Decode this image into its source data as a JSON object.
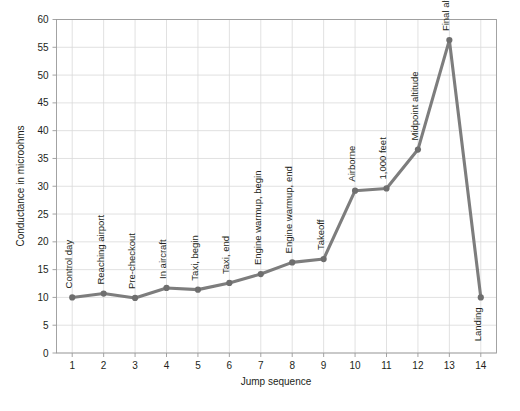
{
  "chart_data": {
    "type": "line",
    "title": "",
    "xlabel": "Jump sequence",
    "ylabel": "Conductance in microohms",
    "x": [
      1,
      2,
      3,
      4,
      5,
      6,
      7,
      8,
      9,
      10,
      11,
      12,
      13,
      14
    ],
    "xtick_labels": [
      "1",
      "2",
      "3",
      "4",
      "5",
      "6",
      "7",
      "8",
      "9",
      "10",
      "11",
      "12",
      "13",
      "14"
    ],
    "values": [
      10.0,
      10.7,
      9.9,
      11.7,
      11.4,
      12.6,
      14.2,
      16.3,
      16.9,
      29.2,
      29.6,
      36.6,
      56.3,
      10.0
    ],
    "point_labels": [
      "Control day",
      "Reaching airport",
      "Pre-checkout",
      "In aircraft",
      "Taxi, begin",
      "Taxi, end",
      "Engine warmup, begin",
      "Engine warmup, end",
      "Takeoff",
      "Airborne",
      "1,000 feet",
      "Midpoint altitude",
      "Final altitude",
      "Landing"
    ],
    "point_label_placement": [
      "above",
      "above",
      "above",
      "above",
      "above",
      "above",
      "above",
      "above",
      "above",
      "above",
      "above",
      "above",
      "above",
      "below"
    ],
    "ylim": [
      0,
      60
    ],
    "ytick_labels": [
      "0",
      "5",
      "10",
      "15",
      "20",
      "25",
      "30",
      "35",
      "40",
      "45",
      "50",
      "55",
      "60"
    ],
    "yticks": [
      0,
      5,
      10,
      15,
      20,
      25,
      30,
      35,
      40,
      45,
      50,
      55,
      60
    ],
    "grid": true,
    "legend": "none",
    "series_color": "#7d7d7d",
    "grid_color": "#d9d9d9",
    "axis_color": "#9a9a9a",
    "text_color": "#231f20",
    "background": "#ffffff"
  }
}
